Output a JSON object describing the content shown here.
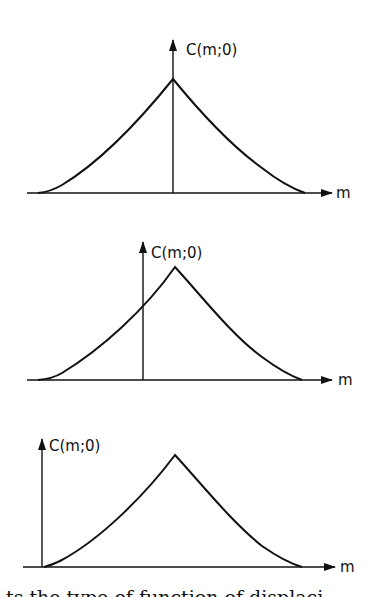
{
  "figure": {
    "panels": [
      {
        "id": "panel-1",
        "y_axis_label": "C(m;0)",
        "x_axis_label": "m",
        "description": "Peak centered on vertical axis (zero displacement)"
      },
      {
        "id": "panel-2",
        "y_axis_label": "C(m;0)",
        "x_axis_label": "m",
        "description": "Peak shifted right of vertical axis"
      },
      {
        "id": "panel-3",
        "y_axis_label": "C(m;0)",
        "x_axis_label": "m",
        "description": "Vertical axis at left edge of curve"
      }
    ],
    "caption_partial": "ts the type of function of displaci"
  },
  "colors": {
    "ink": "#111111",
    "background": "#ffffff"
  }
}
